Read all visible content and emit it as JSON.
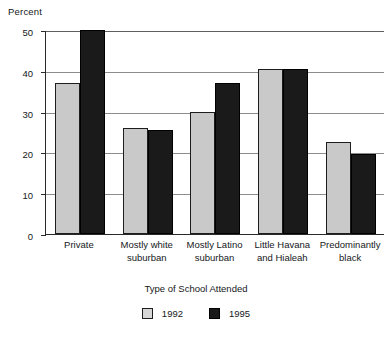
{
  "chart_data": {
    "type": "bar",
    "title": "",
    "xlabel": "Type of School Attended",
    "ylabel": "Percent",
    "ylim": [
      0,
      50
    ],
    "yticks": [
      0,
      10,
      20,
      30,
      40,
      50
    ],
    "ytick_labels": [
      "0",
      "10",
      "20",
      "30",
      "40",
      "50"
    ],
    "grid": true,
    "legend_position": "bottom",
    "categories": [
      "Private",
      "Mostly white suburban",
      "Mostly Latino suburban",
      "Little Havana and Hialeah",
      "Predominantly black"
    ],
    "category_lines": [
      [
        "Private"
      ],
      [
        "Mostly white",
        "suburban"
      ],
      [
        "Mostly Latino",
        "suburban"
      ],
      [
        "Little Havana",
        "and Hialeah"
      ],
      [
        "Predominantly",
        "black"
      ]
    ],
    "series": [
      {
        "name": "1992",
        "color": "#c9c9c9",
        "values": [
          37,
          26,
          30,
          40.5,
          22.5
        ]
      },
      {
        "name": "1995",
        "color": "#1a1a1a",
        "values": [
          50,
          25.5,
          37,
          40.5,
          19.5
        ]
      }
    ]
  },
  "legend": {
    "items": [
      {
        "label": "1992",
        "series": 0
      },
      {
        "label": "1995",
        "series": 1
      }
    ]
  }
}
